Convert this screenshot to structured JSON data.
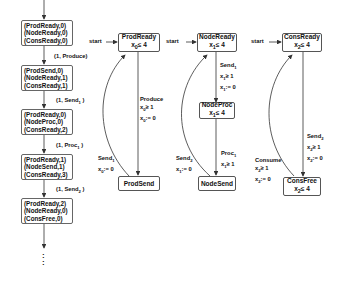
{
  "trace": {
    "states": [
      [
        "(ProdReady,0)",
        "(NodeReady,0)",
        "(ConsReady,0)"
      ],
      [
        "(ProdSend,0)",
        "(NodeReady,1)",
        "(ConsReady,1)"
      ],
      [
        "(ProdReady,0)",
        "(NodeProc,0)",
        "(ConsReady,2)"
      ],
      [
        "(ProdReady,1)",
        "(NodeSend,1)",
        "(ConsReady,3)"
      ],
      [
        "(ProdReady,2)",
        "(NodeReady,0)",
        "(ConsFree,0)"
      ]
    ],
    "transitions": [
      "(1, Produce)",
      "(1, Send",
      "(1, Proc",
      "(1, Send"
    ],
    "transition_subs": [
      "",
      "1",
      "1",
      "2"
    ],
    "continuation": ":"
  },
  "automata": {
    "start_label": "start",
    "producer": {
      "ready": {
        "name": "ProdReady",
        "inv": "x",
        "inv_sub": "0",
        "inv_rest": "≤ 4"
      },
      "send": {
        "name": "ProdSend"
      },
      "produce_edge": {
        "action": "Produce",
        "guard": "x",
        "guard_sub": "0",
        "guard_rest": "≥ 1",
        "reset": "x",
        "reset_sub": "0",
        "reset_rest": ":= 0"
      },
      "send_edge": {
        "action": "Send",
        "action_sub": "1",
        "reset": "x",
        "reset_sub": "0",
        "reset_rest": ":= 0"
      }
    },
    "node": {
      "ready": {
        "name": "NodeReady",
        "inv": "x",
        "inv_sub": "1",
        "inv_rest": "≤ 4"
      },
      "proc": {
        "name": "NodeProc",
        "inv": "x",
        "inv_sub": "1",
        "inv_rest": "≤ 4"
      },
      "send": {
        "name": "NodeSend"
      },
      "send1_edge": {
        "action": "Send",
        "action_sub": "1",
        "guard": "x",
        "guard_sub": "1",
        "guard_rest": "≥ 1",
        "reset": "x",
        "reset_sub": "1",
        "reset_rest": ":= 0"
      },
      "proc_edge": {
        "action": "Proc",
        "action_sub": "1",
        "guard": "x",
        "guard_sub": "1",
        "guard_rest": "≥ 1"
      },
      "send2_edge": {
        "action": "Send",
        "action_sub": "2",
        "reset": "x",
        "reset_sub": "1",
        "reset_rest": ":= 0"
      }
    },
    "consumer": {
      "ready": {
        "name": "ConsReady",
        "inv": "x",
        "inv_sub": "2",
        "inv_rest": "≤ 4"
      },
      "free": {
        "name": "ConsFree",
        "inv": "x",
        "inv_sub": "2",
        "inv_rest": "≤ 4"
      },
      "send2_edge": {
        "action": "Send",
        "action_sub": "2",
        "guard": "x",
        "guard_sub": "2",
        "guard_rest": "≥ 1",
        "reset": "x",
        "reset_sub": "2",
        "reset_rest": ":= 0"
      },
      "consume_edge": {
        "action": "Consume",
        "guard": "x",
        "guard_sub": "2",
        "guard_rest": "≥ 1",
        "reset": "x",
        "reset_sub": "2",
        "reset_rest": ":= 0"
      }
    }
  }
}
